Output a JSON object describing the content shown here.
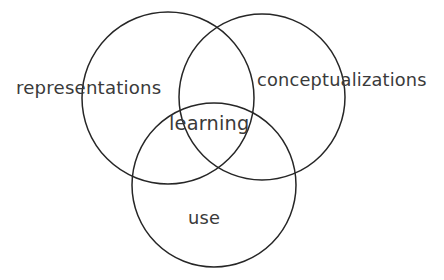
{
  "diagram": {
    "type": "venn-3-set",
    "title": "",
    "background_color": "#ffffff",
    "stroke_color": "#262626",
    "text_color": "#3a3a3a",
    "stroke_width": 1.5,
    "canvas": {
      "width": 444,
      "height": 280
    },
    "sets": [
      {
        "id": "representations",
        "label": "representations",
        "position": "top-left",
        "label_placement": "outside-left",
        "circle": {
          "cx": 168,
          "cy": 98,
          "r": 86
        }
      },
      {
        "id": "conceptualizations",
        "label": "conceptualizations",
        "position": "top-right",
        "label_placement": "outside-right",
        "circle": {
          "cx": 262,
          "cy": 97,
          "r": 83
        }
      },
      {
        "id": "use",
        "label": "use",
        "position": "bottom",
        "label_placement": "inside-bottom",
        "circle": {
          "cx": 214,
          "cy": 185,
          "r": 82
        }
      }
    ],
    "intersection": {
      "id": "learning",
      "label": "learning",
      "description": "center region where all three circles overlap",
      "center": {
        "x": 211,
        "y": 124
      }
    }
  }
}
